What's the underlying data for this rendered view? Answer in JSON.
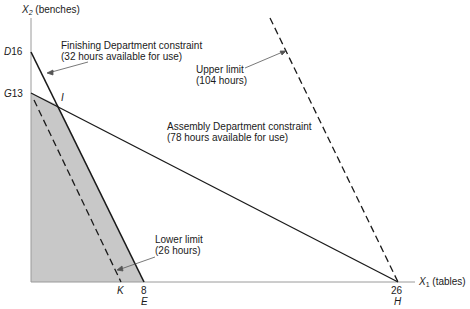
{
  "axes": {
    "y_label_var": "X",
    "y_label_sub": "2",
    "y_label_unit": "(benches)",
    "x_label_var": "X",
    "x_label_sub": "1",
    "x_label_unit": "(tables)"
  },
  "points": {
    "D": {
      "letter": "D",
      "value": "16"
    },
    "G": {
      "letter": "G",
      "value": "13"
    },
    "I": {
      "letter": "I"
    },
    "K": {
      "letter": "K"
    },
    "E": {
      "letter": "E",
      "value": "8"
    },
    "H": {
      "letter": "H",
      "value": "26"
    }
  },
  "annotations": {
    "finishing": {
      "line1": "Finishing Department constraint",
      "line2": "(32 hours available for use)"
    },
    "upper": {
      "line1": "Upper limit",
      "line2": "(104 hours)"
    },
    "assembly": {
      "line1": "Assembly Department constraint",
      "line2": "(78 hours available for use)"
    },
    "lower": {
      "line1": "Lower limit",
      "line2": "(26 hours)"
    }
  },
  "colors": {
    "feasible_region": "#c8c8c8",
    "lines": "#1a1a1a",
    "axis": "#9a9a9a"
  }
}
